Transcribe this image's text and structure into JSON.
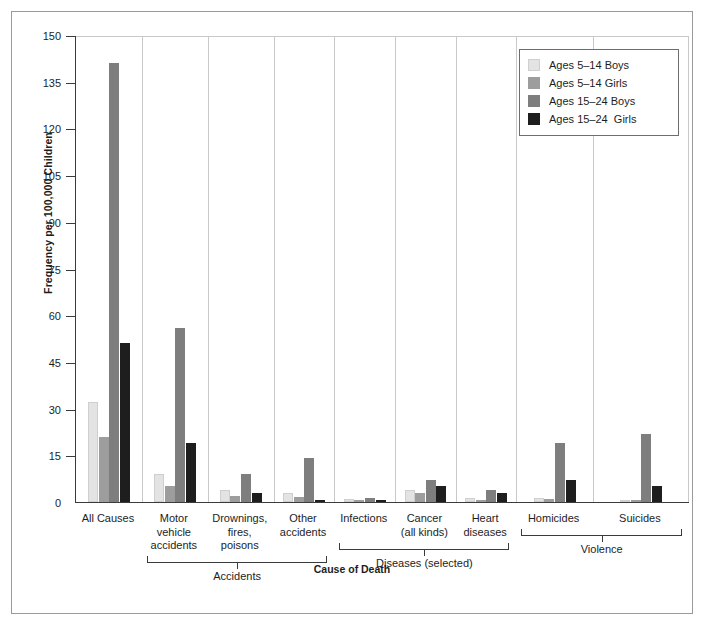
{
  "chart_data": {
    "type": "bar",
    "title": "",
    "xlabel": "Cause of Death",
    "ylabel": "Frequency per 100,000 Children",
    "ylim": [
      0,
      150
    ],
    "ytick_step": 15,
    "yticks": [
      "150",
      "135",
      "120",
      "105",
      "90",
      "75",
      "60",
      "45",
      "30",
      "15",
      "0"
    ],
    "grid": false,
    "legend_position": "top-right",
    "categories": [
      "All Causes",
      "Motor vehicle accidents",
      "Drownings, fires, poisons",
      "Other accidents",
      "Infections",
      "Cancer (all kinds)",
      "Heart diseases",
      "Homicides",
      "Suicides"
    ],
    "series": [
      {
        "name": "Ages 5–14 Boys",
        "color": "#e3e3e3",
        "values": [
          32,
          9,
          4,
          3,
          1.0,
          4,
          1.2,
          1.2,
          0.8
        ]
      },
      {
        "name": "Ages 5–14 Girls",
        "color": "#9d9d9d",
        "values": [
          21,
          5,
          2,
          1.5,
          0.8,
          3,
          0.8,
          1.0,
          0.5
        ]
      },
      {
        "name": "Ages 15–24 Boys",
        "color": "#7e7e7e",
        "values": [
          141,
          56,
          9,
          14,
          1.2,
          7,
          4,
          19,
          22
        ]
      },
      {
        "name": "Ages 15–24  Girls",
        "color": "#1e1e1e",
        "values": [
          51,
          19,
          3,
          0.6,
          0.8,
          5,
          3,
          7,
          5
        ]
      }
    ],
    "group_brackets": [
      {
        "label": "Accidents",
        "from": 1,
        "to": 3
      },
      {
        "label": "Diseases (selected)",
        "from": 4,
        "to": 6
      },
      {
        "label": "Violence",
        "from": 7,
        "to": 8
      }
    ]
  },
  "axis": {
    "y_title": "Frequency per 100,000 Children",
    "x_title": "Cause of Death"
  },
  "legend": {
    "items": [
      {
        "label": "Ages 5–14 Boys"
      },
      {
        "label": "Ages 5–14 Girls"
      },
      {
        "label": "Ages 15–24 Boys"
      },
      {
        "label": "Ages 15–24  Girls"
      }
    ]
  },
  "category_labels": [
    "All Causes",
    "Motor\nvehicle\naccidents",
    "Drownings,\nfires,\npoisons",
    "Other\naccidents",
    "Infections",
    "Cancer\n(all kinds)",
    "Heart\ndiseases",
    "Homicides",
    "Suicides"
  ],
  "bracket_labels": [
    "Accidents",
    "Diseases (selected)",
    "Violence"
  ]
}
